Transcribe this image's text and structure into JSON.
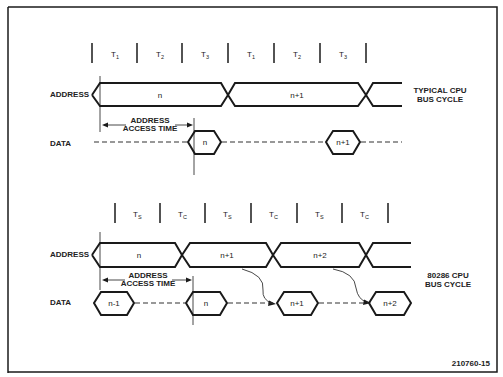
{
  "diagram": {
    "figure_id": "210760-15",
    "top": {
      "caption_line1": "TYPICAL CPU",
      "caption_line2": "BUS CYCLE",
      "states": [
        "T",
        "T",
        "T",
        "T",
        "T",
        "T"
      ],
      "state_subs": [
        "1",
        "2",
        "3",
        "1",
        "2",
        "3"
      ],
      "address_label": "ADDRESS",
      "data_label": "DATA",
      "address_values": [
        "n",
        "n+1"
      ],
      "data_values": [
        "n",
        "n+1"
      ],
      "access_time_line1": "ADDRESS",
      "access_time_line2": "ACCESS TIME"
    },
    "bottom": {
      "caption_line1": "80286 CPU",
      "caption_line2": "BUS CYCLE",
      "states": [
        "T",
        "T",
        "T",
        "T",
        "T",
        "T"
      ],
      "state_subs": [
        "S",
        "C",
        "S",
        "C",
        "S",
        "C"
      ],
      "address_label": "ADDRESS",
      "data_label": "DATA",
      "address_values": [
        "n",
        "n+1",
        "n+2"
      ],
      "data_values": [
        "n-1",
        "n",
        "n+1",
        "n+2"
      ],
      "access_time_line1": "ADDRESS",
      "access_time_line2": "ACCESS TIME"
    }
  }
}
